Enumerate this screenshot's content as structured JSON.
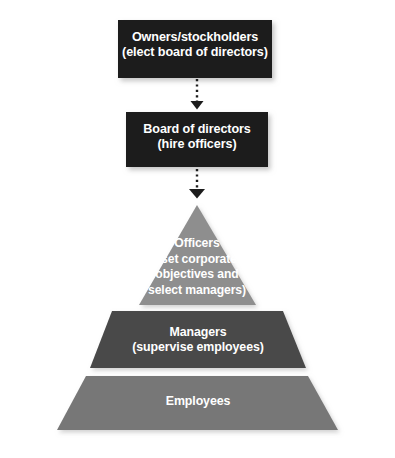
{
  "diagram": {
    "nodes": {
      "owners": {
        "label": "Owners/stockholders\n(elect board of directors)",
        "shape": "rectangle",
        "fill": "#1c1c1c",
        "text_color": "#ffffff"
      },
      "board": {
        "label": "Board of directors\n(hire officers)",
        "shape": "rectangle",
        "fill": "#1c1c1c",
        "text_color": "#ffffff"
      },
      "officers": {
        "label": "Officers\n(set corporate\nobjectives and\nselect managers)",
        "shape": "pyramid-apex-triangle",
        "fill": "#8e8e8e",
        "text_color": "#ffffff"
      },
      "managers": {
        "label": "Managers\n(supervise employees)",
        "shape": "pyramid-middle-trapezoid",
        "fill": "#4a4a4a",
        "text_color": "#ffffff"
      },
      "employees": {
        "label": "Employees",
        "shape": "pyramid-base-trapezoid",
        "fill": "#777777",
        "text_color": "#ffffff"
      }
    },
    "connectors": [
      {
        "name": "owners-to-board",
        "from": "owners",
        "to": "board",
        "style": "dotted",
        "arrowhead": "filled-triangle",
        "color": "#1c1c1c"
      },
      {
        "name": "board-to-officers",
        "from": "board",
        "to": "officers",
        "style": "dotted",
        "arrowhead": "filled-triangle",
        "color": "#1c1c1c"
      }
    ],
    "background": "#ffffff"
  }
}
